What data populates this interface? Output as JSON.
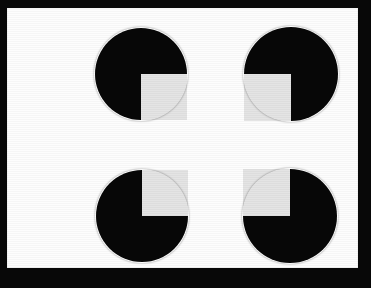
{
  "figure": {
    "title": "Kanizsa square illusion",
    "description": "Four black pac-man inducer discs arranged at the corners of a square, each with one quadrant removed and facing inward, producing an illusory white square.",
    "canvas": {
      "width": 371,
      "height": 288
    },
    "colors": {
      "frame": "#080808",
      "card": "#fdfdfd",
      "disc": "#070707",
      "notch": "#e4e4e4"
    },
    "frame": {
      "left": 7,
      "top": 8,
      "width": 351,
      "height": 260
    },
    "illusory_square": {
      "left": 142,
      "top": 74,
      "width": 149,
      "height": 142,
      "label": "illusory square"
    },
    "inducers": [
      {
        "id": "top-left",
        "label": "Top-left inducer",
        "center_x": 141,
        "center_y": 74,
        "radius": 46,
        "notch_quadrant": "bottom-right"
      },
      {
        "id": "top-right",
        "label": "Top-right inducer",
        "center_x": 291,
        "center_y": 74,
        "radius": 47,
        "notch_quadrant": "bottom-left"
      },
      {
        "id": "bottom-left",
        "label": "Bottom-left inducer",
        "center_x": 142,
        "center_y": 216,
        "radius": 46,
        "notch_quadrant": "top-right"
      },
      {
        "id": "bottom-right",
        "label": "Bottom-right inducer",
        "center_x": 290,
        "center_y": 216,
        "radius": 47,
        "notch_quadrant": "top-left"
      }
    ]
  }
}
